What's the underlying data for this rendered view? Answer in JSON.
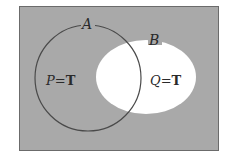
{
  "diagram": {
    "type": "venn",
    "universe": {
      "fill": "#a9a9a9",
      "stroke": "#6b6b6b"
    },
    "sets": [
      {
        "name": "A",
        "label": "A",
        "region_label": "P=T",
        "var": "P",
        "eq": "=",
        "val": "T",
        "shape": "circle",
        "fill": "none",
        "stroke": "#4a4a4a"
      },
      {
        "name": "B",
        "label": "B",
        "region_label": "Q=T",
        "var": "Q",
        "eq": "=",
        "val": "T",
        "shape": "ellipse",
        "fill": "#ffffff",
        "stroke": "#ffffff"
      }
    ],
    "shaded": "complement of B"
  }
}
